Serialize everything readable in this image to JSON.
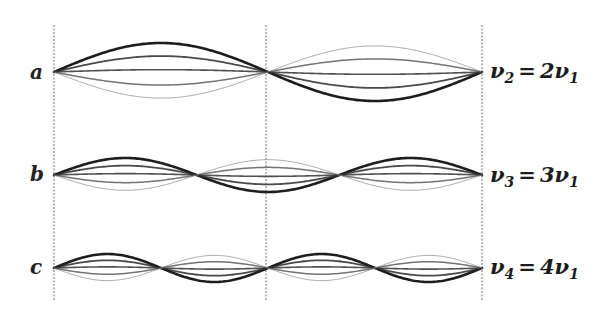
{
  "diagram": {
    "string": {
      "x_start": 54,
      "x_mid": 266,
      "x_end": 482
    },
    "guides": {
      "x": [
        54,
        266,
        482
      ],
      "y_top": 25,
      "y_bottom": 300,
      "color": "#8a8a8a"
    },
    "rows": [
      {
        "label": "a",
        "center_y": 72,
        "amplitude": 29,
        "loops": 2,
        "equation": {
          "lhs_symbol": "ν",
          "lhs_sub": "2",
          "op": "=",
          "coef": "2",
          "rhs_symbol": "ν",
          "rhs_sub": "1"
        },
        "label_pos": {
          "x": 30,
          "y": 62
        },
        "eq_pos": {
          "x": 490,
          "y": 60
        }
      },
      {
        "label": "b",
        "center_y": 175,
        "amplitude": 17,
        "loops": 3,
        "equation": {
          "lhs_symbol": "ν",
          "lhs_sub": "3",
          "op": "=",
          "coef": "3",
          "rhs_symbol": "ν",
          "rhs_sub": "1"
        },
        "label_pos": {
          "x": 30,
          "y": 164
        },
        "eq_pos": {
          "x": 490,
          "y": 164
        }
      },
      {
        "label": "c",
        "center_y": 268,
        "amplitude": 14,
        "loops": 4,
        "equation": {
          "lhs_symbol": "ν",
          "lhs_sub": "4",
          "op": "=",
          "coef": "4",
          "rhs_symbol": "ν",
          "rhs_sub": "1"
        },
        "label_pos": {
          "x": 30,
          "y": 257
        },
        "eq_pos": {
          "x": 490,
          "y": 256
        }
      }
    ],
    "curve_styles": [
      {
        "factor": 1.0,
        "color": "#111111",
        "width": 2.6,
        "opacity": 0.95
      },
      {
        "factor": 0.55,
        "color": "#2a2a2a",
        "width": 1.8,
        "opacity": 0.85
      },
      {
        "factor": 0.08,
        "color": "#333333",
        "width": 1.6,
        "opacity": 0.85
      },
      {
        "factor": -0.45,
        "color": "#444444",
        "width": 1.5,
        "opacity": 0.75
      },
      {
        "factor": -0.9,
        "color": "#8a8a8a",
        "width": 1.0,
        "opacity": 0.7
      }
    ]
  }
}
